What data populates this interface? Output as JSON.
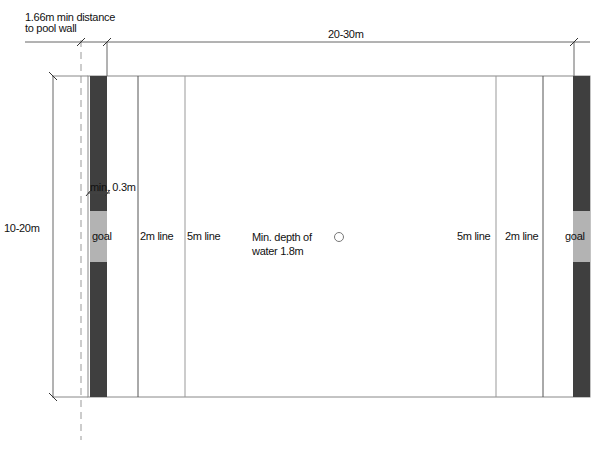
{
  "dimensions": {
    "wall_distance_label_1": "1.66m min distance",
    "wall_distance_label_2": "to pool wall",
    "length_label": "20-30m",
    "width_label": "10-20m",
    "goal_line_label": "min. 0.3m"
  },
  "field": {
    "left_goal": "goal",
    "right_goal": "goal",
    "left_2m": "2m line",
    "left_5m": "5m line",
    "right_5m": "5m line",
    "right_2m": "2m line",
    "depth_line1": "Min. depth of",
    "depth_line2": "water 1.8m"
  },
  "colors": {
    "goal_strip": "#3f3f3f",
    "goal": "#b3b3b3",
    "line": "#555555"
  }
}
